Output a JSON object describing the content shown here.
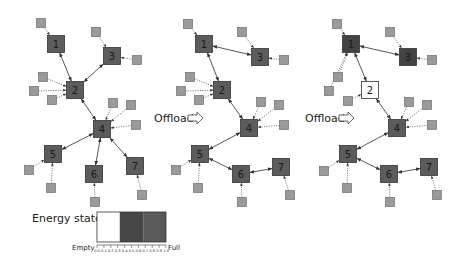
{
  "figure": {
    "colors": {
      "node_fill": "#5c5c5c",
      "node_fill_charged": "#434343",
      "node_fill_empty": "#ffffff",
      "node_stroke": "#333333",
      "device_fill": "#9a9a9a",
      "device_stroke": "#6e6e6e",
      "link": "#444444",
      "device_link": "#666666"
    },
    "panels": [
      {
        "id": "before",
        "offload_label": null,
        "nodes": [
          {
            "id": "1",
            "x": 56,
            "y": 44,
            "state": "normal"
          },
          {
            "id": "2",
            "x": 75,
            "y": 90,
            "state": "normal"
          },
          {
            "id": "3",
            "x": 112,
            "y": 56,
            "state": "normal"
          },
          {
            "id": "4",
            "x": 102,
            "y": 129,
            "state": "normal"
          },
          {
            "id": "5",
            "x": 53,
            "y": 154,
            "state": "normal"
          },
          {
            "id": "6",
            "x": 94,
            "y": 174,
            "state": "normal"
          },
          {
            "id": "7",
            "x": 135,
            "y": 166,
            "state": "normal"
          }
        ],
        "links": [
          [
            "1",
            "2"
          ],
          [
            "2",
            "3"
          ],
          [
            "2",
            "4"
          ],
          [
            "4",
            "5"
          ],
          [
            "4",
            "6"
          ],
          [
            "4",
            "7"
          ]
        ],
        "devices": [
          {
            "x": 41,
            "y": 23,
            "to": "1"
          },
          {
            "x": 96,
            "y": 32,
            "to": "3"
          },
          {
            "x": 137,
            "y": 60,
            "to": "3"
          },
          {
            "x": 43,
            "y": 77,
            "to": "2"
          },
          {
            "x": 34,
            "y": 91,
            "to": "2"
          },
          {
            "x": 52,
            "y": 100,
            "to": "2"
          },
          {
            "x": 113,
            "y": 103,
            "to": "4"
          },
          {
            "x": 131,
            "y": 105,
            "to": "4"
          },
          {
            "x": 136,
            "y": 125,
            "to": "4"
          },
          {
            "x": 29,
            "y": 170,
            "to": "5"
          },
          {
            "x": 51,
            "y": 188,
            "to": "5"
          },
          {
            "x": 95,
            "y": 202,
            "to": "6"
          },
          {
            "x": 142,
            "y": 195,
            "to": "7"
          }
        ]
      },
      {
        "id": "offload-1",
        "offload_label": "Offload",
        "offload_pos": {
          "x": 154,
          "y": 122,
          "arrow_x": 188,
          "arrow_y": 118
        },
        "nodes": [
          {
            "id": "1",
            "x": 204,
            "y": 44,
            "state": "normal"
          },
          {
            "id": "2",
            "x": 222,
            "y": 90,
            "state": "normal"
          },
          {
            "id": "3",
            "x": 260,
            "y": 57,
            "state": "normal"
          },
          {
            "id": "4",
            "x": 249,
            "y": 128,
            "state": "normal"
          },
          {
            "id": "5",
            "x": 200,
            "y": 154,
            "state": "normal"
          },
          {
            "id": "6",
            "x": 241,
            "y": 174,
            "state": "normal"
          },
          {
            "id": "7",
            "x": 281,
            "y": 167,
            "state": "normal"
          }
        ],
        "links": [
          [
            "1",
            "2"
          ],
          [
            "1",
            "3"
          ],
          [
            "2",
            "4"
          ],
          [
            "4",
            "5"
          ],
          [
            "5",
            "6"
          ],
          [
            "6",
            "7"
          ]
        ],
        "devices": [
          {
            "x": 188,
            "y": 24,
            "to": "1"
          },
          {
            "x": 242,
            "y": 32,
            "to": "3"
          },
          {
            "x": 284,
            "y": 60,
            "to": "3"
          },
          {
            "x": 190,
            "y": 77,
            "to": "2"
          },
          {
            "x": 181,
            "y": 91,
            "to": "2"
          },
          {
            "x": 199,
            "y": 100,
            "to": "2"
          },
          {
            "x": 261,
            "y": 102,
            "to": "4"
          },
          {
            "x": 279,
            "y": 105,
            "to": "4"
          },
          {
            "x": 284,
            "y": 125,
            "to": "4"
          },
          {
            "x": 176,
            "y": 170,
            "to": "5"
          },
          {
            "x": 198,
            "y": 188,
            "to": "5"
          },
          {
            "x": 242,
            "y": 202,
            "to": "6"
          },
          {
            "x": 290,
            "y": 195,
            "to": "7"
          }
        ]
      },
      {
        "id": "offload-2",
        "offload_label": "Offload",
        "offload_pos": {
          "x": 305,
          "y": 122,
          "arrow_x": 339,
          "arrow_y": 118
        },
        "nodes": [
          {
            "id": "1",
            "x": 351,
            "y": 44,
            "state": "charged"
          },
          {
            "id": "2",
            "x": 370,
            "y": 90,
            "state": "empty"
          },
          {
            "id": "3",
            "x": 408,
            "y": 57,
            "state": "charged"
          },
          {
            "id": "4",
            "x": 397,
            "y": 128,
            "state": "normal"
          },
          {
            "id": "5",
            "x": 348,
            "y": 154,
            "state": "normal"
          },
          {
            "id": "6",
            "x": 389,
            "y": 174,
            "state": "normal"
          },
          {
            "id": "7",
            "x": 429,
            "y": 167,
            "state": "normal"
          }
        ],
        "links": [
          [
            "1",
            "2"
          ],
          [
            "1",
            "3"
          ],
          [
            "2",
            "4"
          ],
          [
            "4",
            "5"
          ],
          [
            "5",
            "6"
          ],
          [
            "6",
            "7"
          ]
        ],
        "devices": [
          {
            "x": 337,
            "y": 24,
            "to": "1"
          },
          {
            "x": 390,
            "y": 32,
            "to": "3"
          },
          {
            "x": 432,
            "y": 60,
            "to": "3"
          },
          {
            "x": 338,
            "y": 77,
            "to": "1"
          },
          {
            "x": 329,
            "y": 91,
            "to": "1"
          },
          {
            "x": 348,
            "y": 101,
            "to": "2"
          },
          {
            "x": 409,
            "y": 102,
            "to": "4"
          },
          {
            "x": 427,
            "y": 105,
            "to": "4"
          },
          {
            "x": 432,
            "y": 125,
            "to": "4"
          },
          {
            "x": 324,
            "y": 171,
            "to": "5"
          },
          {
            "x": 347,
            "y": 188,
            "to": "5"
          },
          {
            "x": 390,
            "y": 202,
            "to": "6"
          },
          {
            "x": 437,
            "y": 195,
            "to": "7"
          }
        ]
      }
    ],
    "legend": {
      "title": "Energy states",
      "empty_label": "Empty",
      "full_label": "Full",
      "bar": {
        "x": 97,
        "y": 212,
        "width": 69,
        "height": 30
      },
      "segments": [
        {
          "from": 0.0,
          "to": 0.33,
          "fill": "#ffffff"
        },
        {
          "from": 0.33,
          "to": 0.67,
          "fill": "#474747"
        },
        {
          "from": 0.67,
          "to": 1.0,
          "fill": "#5a5a5a"
        }
      ],
      "ticks": [
        "0.0",
        "0.1",
        "0.2",
        "0.3",
        "0.4",
        "0.5",
        "0.6",
        "0.7",
        "0.8",
        "0.9",
        "1.0"
      ]
    }
  }
}
